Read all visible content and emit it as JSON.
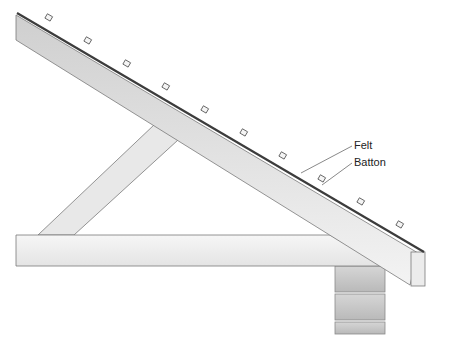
{
  "diagram": {
    "labels": {
      "felt": "Felt",
      "batton": "Batton"
    },
    "components": [
      "rafter",
      "ceiling-joist",
      "strut",
      "wall",
      "fascia",
      "felt",
      "battons"
    ],
    "colors": {
      "timber_light": "#f2f2f2",
      "timber_mid": "#d9d9d9",
      "outline": "#7a7a7a",
      "felt": "#444444",
      "wall": "#c8c8c8"
    }
  }
}
